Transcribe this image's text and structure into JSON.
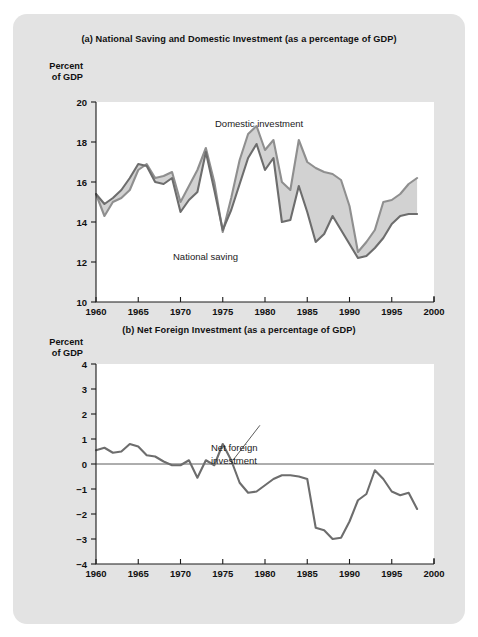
{
  "figure": {
    "background_color": "#e3e3e3",
    "plot_background_color": "#ffffff",
    "series_color": "#8f8f8f",
    "band_color": "#d2d2d2",
    "axis_color": "#1a1a1a"
  },
  "panel_a": {
    "title": "(a) National Saving and Domestic Investment (as a percentage of GDP)",
    "axis_caption_line1": "Percent",
    "axis_caption_line2": "of GDP",
    "label_investment": "Domestic investment",
    "label_saving": "National saving",
    "ytick_labels": [
      "20",
      "18",
      "16",
      "14",
      "12",
      "10"
    ],
    "xtick_labels": [
      "1960",
      "1965",
      "1970",
      "1975",
      "1980",
      "1985",
      "1990",
      "1995",
      "2000"
    ]
  },
  "panel_b": {
    "title": "(b) Net Foreign Investment (as a percentage of GDP)",
    "axis_caption_line1": "Percent",
    "axis_caption_line2": "of GDP",
    "label_line1": "Net foreign",
    "label_line2": "investment",
    "ytick_labels": [
      "4",
      "3",
      "2",
      "1",
      "0",
      "−1",
      "−2",
      "−3",
      "−4"
    ],
    "xtick_labels": [
      "1960",
      "1965",
      "1970",
      "1975",
      "1980",
      "1985",
      "1990",
      "1995",
      "2000"
    ]
  },
  "chart_data": [
    {
      "type": "line",
      "title": "(a) National Saving and Domestic Investment (as a percentage of GDP)",
      "xlabel": "",
      "ylabel": "Percent of GDP",
      "xlim": [
        1960,
        2000
      ],
      "ylim": [
        10,
        20
      ],
      "yticks": [
        10,
        12,
        14,
        16,
        18,
        20
      ],
      "xticks": [
        1960,
        1965,
        1970,
        1975,
        1980,
        1985,
        1990,
        1995,
        2000
      ],
      "grid": false,
      "legend": "inline annotations",
      "annotations": [
        "Domestic investment",
        "National saving"
      ],
      "x": [
        1960,
        1961,
        1962,
        1963,
        1964,
        1965,
        1966,
        1967,
        1968,
        1969,
        1970,
        1971,
        1972,
        1973,
        1974,
        1975,
        1976,
        1977,
        1978,
        1979,
        1980,
        1981,
        1982,
        1983,
        1984,
        1985,
        1986,
        1987,
        1988,
        1989,
        1990,
        1991,
        1992,
        1993,
        1994,
        1995,
        1996,
        1997,
        1998
      ],
      "series": [
        {
          "name": "Domestic investment",
          "values": [
            15.4,
            14.3,
            15.0,
            15.2,
            15.6,
            16.6,
            16.9,
            16.2,
            16.3,
            16.5,
            15.0,
            15.8,
            16.6,
            17.7,
            16.0,
            13.5,
            15.2,
            17.1,
            18.4,
            18.8,
            17.6,
            18.1,
            16.0,
            15.6,
            18.1,
            17.0,
            16.7,
            16.5,
            16.4,
            16.1,
            14.8,
            12.5,
            13.0,
            13.6,
            15.0,
            15.1,
            15.4,
            15.9,
            16.2
          ]
        },
        {
          "name": "National saving",
          "values": [
            15.4,
            14.9,
            15.2,
            15.6,
            16.2,
            16.9,
            16.8,
            16.0,
            15.9,
            16.2,
            14.5,
            15.1,
            15.5,
            17.5,
            15.6,
            13.6,
            14.6,
            15.9,
            17.2,
            17.9,
            16.6,
            17.2,
            14.0,
            14.1,
            15.8,
            14.5,
            13.0,
            13.4,
            14.3,
            13.6,
            12.9,
            12.2,
            12.3,
            12.7,
            13.2,
            13.9,
            14.3,
            14.4,
            14.4
          ]
        }
      ]
    },
    {
      "type": "line",
      "title": "(b) Net Foreign Investment (as a percentage of GDP)",
      "xlabel": "",
      "ylabel": "Percent of GDP",
      "xlim": [
        1960,
        2000
      ],
      "ylim": [
        -4,
        4
      ],
      "yticks": [
        -4,
        -3,
        -2,
        -1,
        0,
        1,
        2,
        3,
        4
      ],
      "xticks": [
        1960,
        1965,
        1970,
        1975,
        1980,
        1985,
        1990,
        1995,
        2000
      ],
      "grid": false,
      "zero_line": 0,
      "annotations": [
        "Net foreign investment"
      ],
      "x": [
        1960,
        1961,
        1962,
        1963,
        1964,
        1965,
        1966,
        1967,
        1968,
        1969,
        1970,
        1971,
        1972,
        1973,
        1974,
        1975,
        1976,
        1977,
        1978,
        1979,
        1980,
        1981,
        1982,
        1983,
        1984,
        1985,
        1986,
        1987,
        1988,
        1989,
        1990,
        1991,
        1992,
        1993,
        1994,
        1995,
        1996,
        1997,
        1998
      ],
      "series": [
        {
          "name": "Net foreign investment",
          "values": [
            0.55,
            0.65,
            0.45,
            0.5,
            0.8,
            0.7,
            0.35,
            0.3,
            0.1,
            -0.05,
            -0.05,
            0.15,
            -0.55,
            0.15,
            -0.05,
            0.8,
            0.15,
            -0.75,
            -1.15,
            -1.1,
            -0.85,
            -0.6,
            -0.45,
            -0.45,
            -0.5,
            -0.6,
            -2.55,
            -2.65,
            -3.0,
            -2.95,
            -2.3,
            -1.45,
            -1.2,
            -0.25,
            -0.6,
            -1.1,
            -1.25,
            -1.15,
            -1.8
          ]
        }
      ]
    }
  ]
}
